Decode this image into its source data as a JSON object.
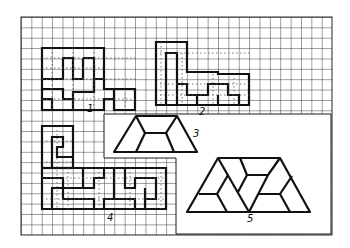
{
  "figure": {
    "grid": {
      "cols": 30,
      "rows": 21,
      "origin_x": 21,
      "origin_y": 17,
      "cell": 10.37
    },
    "colors": {
      "line": "#1a1a1a",
      "grid": "#2a2a2a",
      "background": "#ffffff",
      "dots": "#555555"
    },
    "labels": [
      {
        "id": "1",
        "text": "1",
        "x": 87,
        "y": 112
      },
      {
        "id": "2",
        "text": "2",
        "x": 199,
        "y": 115
      },
      {
        "id": "3",
        "text": "3",
        "x": 193,
        "y": 137
      },
      {
        "id": "4",
        "text": "4",
        "x": 107,
        "y": 221
      },
      {
        "id": "5",
        "text": "5",
        "x": 247,
        "y": 222
      }
    ]
  }
}
